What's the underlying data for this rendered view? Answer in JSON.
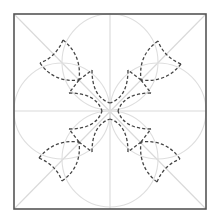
{
  "diagram": {
    "title": "Quilt pattern template: dashed cross with corner petals",
    "canvas": {
      "width": 219,
      "height": 215,
      "background": "#ffffff"
    },
    "frame": {
      "x": 14,
      "y": 14,
      "width": 192,
      "height": 195,
      "stroke": "#555555"
    },
    "center": {
      "x": 110,
      "y": 111
    },
    "guides": {
      "stroke": "#d9d9d9",
      "lines": [
        "diagonal-tl-br",
        "diagonal-tr-bl",
        "horizontal-midline",
        "vertical-midline"
      ]
    },
    "circles": {
      "stroke": "#dedede",
      "radius": 48,
      "centers": [
        [
          110,
          62
        ],
        [
          62,
          111
        ],
        [
          158,
          111
        ],
        [
          110,
          159
        ]
      ]
    },
    "dashed_shape": {
      "stroke": "#444444",
      "description": "Four-armed cross along the diagonals with a curved-triangle petal at the end of each arm",
      "arms": 4,
      "petals": 4
    }
  }
}
